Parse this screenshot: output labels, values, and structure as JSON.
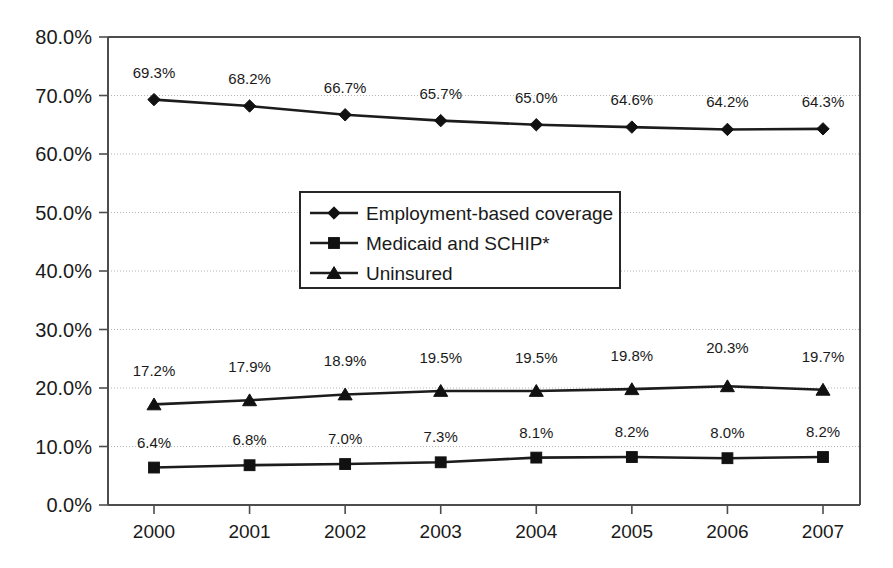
{
  "chart_data": {
    "type": "line",
    "title": "",
    "subtitle": "",
    "xlabel": "",
    "ylabel": "",
    "categories": [
      "2000",
      "2001",
      "2002",
      "2003",
      "2004",
      "2005",
      "2006",
      "2007"
    ],
    "x": [
      2000,
      2001,
      2002,
      2003,
      2004,
      2005,
      2006,
      2007
    ],
    "ylim": [
      0,
      80
    ],
    "ytick_values": [
      0,
      10,
      20,
      30,
      40,
      50,
      60,
      70,
      80
    ],
    "ytick_labels": [
      "0.0%",
      "10.0%",
      "20.0%",
      "30.0%",
      "40.0%",
      "50.0%",
      "60.0%",
      "70.0%",
      "80.0%"
    ],
    "grid": true,
    "grid_axis": "y",
    "legend_position": "center-left-inside",
    "value_labels": true,
    "value_label_format": "0.0%",
    "series": [
      {
        "name": "Employment-based coverage",
        "marker": "diamond",
        "color": "#111111",
        "values": [
          69.3,
          68.2,
          66.7,
          65.7,
          65.0,
          64.6,
          64.2,
          64.3
        ],
        "labels": [
          "69.3%",
          "68.2%",
          "66.7%",
          "65.7%",
          "65.0%",
          "64.6%",
          "64.2%",
          "64.3%"
        ]
      },
      {
        "name": "Medicaid and SCHIP*",
        "marker": "square",
        "color": "#111111",
        "values": [
          6.4,
          6.8,
          7.0,
          7.3,
          8.1,
          8.2,
          8.0,
          8.2
        ],
        "labels": [
          "6.4%",
          "6.8%",
          "7.0%",
          "7.3%",
          "8.1%",
          "8.2%",
          "8.0%",
          "8.2%"
        ]
      },
      {
        "name": "Uninsured",
        "marker": "triangle",
        "color": "#111111",
        "values": [
          17.2,
          17.9,
          18.9,
          19.5,
          19.5,
          19.8,
          20.3,
          19.7
        ],
        "labels": [
          "17.2%",
          "17.9%",
          "18.9%",
          "19.5%",
          "19.5%",
          "19.8%",
          "20.3%",
          "19.7%"
        ]
      }
    ]
  },
  "legend": {
    "entries": [
      {
        "label": "Employment-based coverage",
        "marker": "diamond"
      },
      {
        "label": "Medicaid and SCHIP*",
        "marker": "square"
      },
      {
        "label": "Uninsured",
        "marker": "triangle"
      }
    ]
  },
  "axes": {
    "y_labels": [
      "80.0%",
      "70.0%",
      "60.0%",
      "50.0%",
      "40.0%",
      "30.0%",
      "20.0%",
      "10.0%",
      "0.0%"
    ],
    "x_labels": [
      "2000",
      "2001",
      "2002",
      "2003",
      "2004",
      "2005",
      "2006",
      "2007"
    ]
  }
}
